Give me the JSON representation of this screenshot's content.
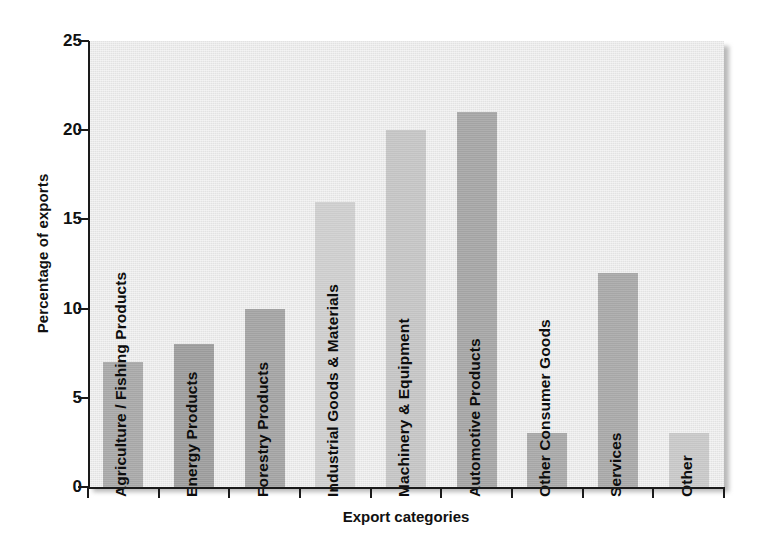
{
  "chart_data": {
    "type": "bar",
    "title": "",
    "subtitle": "",
    "xlabel": "Export categories",
    "ylabel": "Percentage of exports",
    "categories": [
      "Agriculture / Fishing Products",
      "Energy Products",
      "Forestry Products",
      "Industrial Goods & Materials",
      "Machinery & Equipment",
      "Automotive Products",
      "Other Consumer Goods",
      "Services",
      "Other"
    ],
    "values": [
      7,
      8,
      10,
      16,
      20,
      21,
      3,
      12,
      3
    ],
    "ylim": [
      0,
      25
    ],
    "yticks": [
      0,
      5,
      10,
      15,
      20,
      25
    ],
    "ytick_labels": [
      "0",
      "5",
      "10",
      "15",
      "20",
      "25"
    ],
    "grid": false,
    "legend": false,
    "bar_colors": [
      "#a9a9a9",
      "#9d9d9d",
      "#a4a4a4",
      "#cfcfcf",
      "#c6c6c6",
      "#a6a6a6",
      "#a9a9a9",
      "#a9a9a9",
      "#c9c9c9"
    ],
    "plot_background": "#e8e8e8",
    "axis_color": "#1a1a1a",
    "text_color": "#111111"
  }
}
